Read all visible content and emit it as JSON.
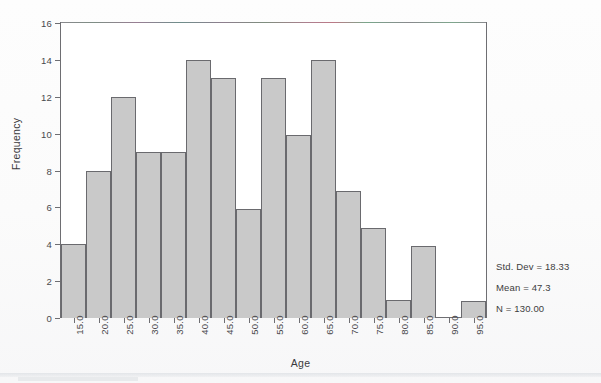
{
  "chart_data": {
    "type": "bar",
    "title": "",
    "subtitle": "",
    "xlabel": "Age",
    "ylabel": "Frequency",
    "xlim": [
      12.5,
      97.5
    ],
    "ylim": [
      0,
      16
    ],
    "grid": false,
    "legend_position": "none",
    "bin_width": 5,
    "x_tick_labels": [
      "15.0",
      "20.0",
      "25.0",
      "30.0",
      "35.0",
      "40.0",
      "45.0",
      "50.0",
      "55.0",
      "60.0",
      "65.0",
      "70.0",
      "75.0",
      "80.0",
      "85.0",
      "90.0",
      "95.0"
    ],
    "x_tick_values": [
      15,
      20,
      25,
      30,
      35,
      40,
      45,
      50,
      55,
      60,
      65,
      70,
      75,
      80,
      85,
      90,
      95
    ],
    "y_tick_labels": [
      "0",
      "2",
      "4",
      "6",
      "8",
      "10",
      "12",
      "14",
      "16"
    ],
    "y_tick_values": [
      0,
      2,
      4,
      6,
      8,
      10,
      12,
      14,
      16
    ],
    "categories": [
      "15.0",
      "20.0",
      "25.0",
      "30.0",
      "35.0",
      "40.0",
      "45.0",
      "50.0",
      "55.0",
      "60.0",
      "65.0",
      "70.0",
      "75.0",
      "80.0",
      "85.0",
      "90.0",
      "95.0"
    ],
    "bin_centers": [
      15,
      20,
      25,
      30,
      35,
      40,
      45,
      50,
      55,
      60,
      65,
      70,
      75,
      80,
      85,
      90,
      95
    ],
    "values": [
      4,
      8,
      12,
      9,
      9,
      14,
      13,
      5.9,
      13,
      9.9,
      14,
      6.9,
      4.9,
      1,
      3.9,
      0,
      0.9
    ],
    "bar_color": "#c9c9c9",
    "bar_edge_color": "#6a6a6e",
    "annotations": [
      "Std. Dev = 18.33",
      "Mean = 47.3",
      "N = 130.00"
    ]
  },
  "stats": {
    "std_dev": "Std. Dev = 18.33",
    "mean": "Mean = 47.3",
    "n": "N = 130.00"
  },
  "axes": {
    "x_title": "Age",
    "y_title": "Frequency"
  }
}
